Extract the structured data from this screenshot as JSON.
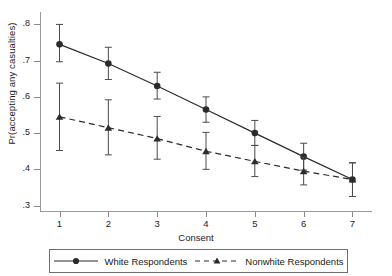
{
  "chart_data": {
    "type": "line",
    "title": "",
    "subtitle": "",
    "xlabel": "Consent",
    "ylabel": "Pr(accepting any casualties)",
    "x": [
      1,
      2,
      3,
      4,
      5,
      6,
      7
    ],
    "xticklabels": [
      "1",
      "2",
      "3",
      "4",
      "5",
      "6",
      "7"
    ],
    "yticklabels": [
      ".3",
      ".4",
      ".5",
      ".6",
      ".7",
      ".8"
    ],
    "yticks": [
      0.3,
      0.4,
      0.5,
      0.6,
      0.7,
      0.8
    ],
    "xlim": [
      0.6,
      7.4
    ],
    "ylim": [
      0.285,
      0.815
    ],
    "grid": false,
    "legend_position": "bottom",
    "error_bars": "95% confidence interval",
    "series": [
      {
        "name": "White Respondents",
        "marker": "circle",
        "linestyle": "solid",
        "color": "#2b2b2b",
        "values": [
          0.745,
          0.692,
          0.63,
          0.565,
          0.5,
          0.435,
          0.372
        ],
        "err_low": [
          0.697,
          0.648,
          0.594,
          0.53,
          0.466,
          0.398,
          0.325
        ],
        "err_high": [
          0.8,
          0.737,
          0.668,
          0.6,
          0.535,
          0.472,
          0.418
        ]
      },
      {
        "name": "Nonwhite Respondents",
        "marker": "triangle",
        "linestyle": "dashed",
        "color": "#2b2b2b",
        "values": [
          0.545,
          0.515,
          0.485,
          0.45,
          0.422,
          0.395,
          0.372
        ],
        "err_low": [
          0.452,
          0.44,
          0.428,
          0.4,
          0.38,
          0.357,
          0.325
        ],
        "err_high": [
          0.638,
          0.592,
          0.546,
          0.502,
          0.466,
          0.434,
          0.418
        ]
      }
    ]
  },
  "legend": {
    "entries": [
      {
        "label": "White Respondents"
      },
      {
        "label": "Nonwhite Respondents"
      }
    ]
  }
}
